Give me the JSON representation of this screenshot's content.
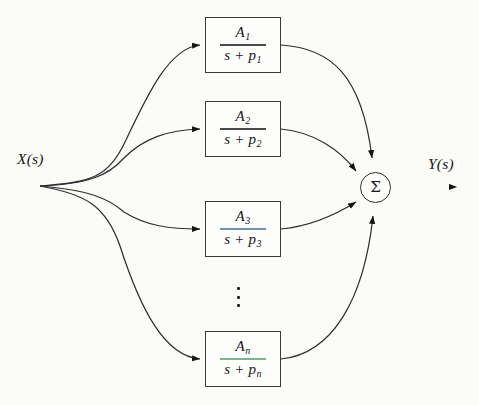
{
  "diagram": {
    "background_color": "#fbfbf8",
    "line_color": "#2f2f33",
    "input": {
      "label": "X(s)",
      "node_name": "input-fanout-node"
    },
    "output": {
      "label": "Y(s)",
      "node_name": "output-arrow"
    },
    "summing_junction": {
      "symbol": "Σ",
      "name": "summing-junction"
    },
    "ellipsis": {
      "symbol": "⋮",
      "dots": 3
    },
    "blocks": [
      {
        "id": "block-1",
        "numerator": "A",
        "numerator_sub": "1",
        "denominator": "s + p",
        "denominator_sub": "1",
        "bar_color": "#4a4a4a",
        "accent_color": "#4e9a4e"
      },
      {
        "id": "block-2",
        "numerator": "A",
        "numerator_sub": "2",
        "denominator": "s + p",
        "denominator_sub": "2",
        "bar_color": "#4a4a4a",
        "accent_color": "#7fc77f"
      },
      {
        "id": "block-3",
        "numerator": "A",
        "numerator_sub": "3",
        "denominator": "s + p",
        "denominator_sub": "3",
        "bar_color": "#6f93b5",
        "accent_color": "#6f93b5"
      },
      {
        "id": "block-n",
        "numerator": "A",
        "numerator_sub": "n",
        "denominator": "s + p",
        "denominator_sub": "n",
        "bar_color": "#7fb58a",
        "accent_color": "#7fb58a"
      }
    ]
  }
}
